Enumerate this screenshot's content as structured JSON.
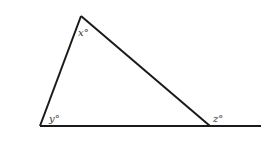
{
  "diagram": {
    "type": "triangle-exterior-angle",
    "labels": {
      "top": "x°",
      "bottom_left": "y°",
      "exterior": "z°"
    },
    "stroke_color": "#1a1a1a"
  }
}
